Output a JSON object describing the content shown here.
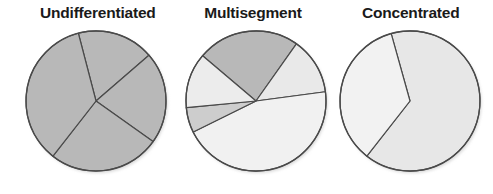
{
  "chart_data": [
    {
      "type": "pie",
      "title": "Undifferentiated",
      "center": [
        96,
        101
      ],
      "radius": 70,
      "start_angle_deg": 255.4,
      "slices": [
        {
          "label": "segment-1",
          "percent": 17.7,
          "color": "#b8b8b8"
        },
        {
          "label": "segment-2",
          "percent": 21.2,
          "color": "#b8b8b8"
        },
        {
          "label": "segment-3",
          "percent": 25.7,
          "color": "#b8b8b8"
        },
        {
          "label": "segment-4",
          "percent": 35.4,
          "color": "#b8b8b8"
        }
      ]
    },
    {
      "type": "pie",
      "title": "Multisegment",
      "center": [
        256,
        101
      ],
      "radius": 70,
      "start_angle_deg": 220.3,
      "slices": [
        {
          "label": "segment-1",
          "percent": 23.6,
          "color": "#b8b8b8"
        },
        {
          "label": "segment-2",
          "percent": 13.1,
          "color": "#e9e9e9"
        },
        {
          "label": "segment-3",
          "percent": 44.8,
          "color": "#f1f1f1"
        },
        {
          "label": "segment-4",
          "percent": 5.8,
          "color": "#cdcdcd"
        },
        {
          "label": "segment-5",
          "percent": 12.7,
          "color": "#ececec"
        }
      ]
    },
    {
      "type": "pie",
      "title": "Concentrated",
      "center": [
        410,
        101
      ],
      "radius": 70,
      "start_angle_deg": 254.4,
      "slices": [
        {
          "label": "segment-1",
          "percent": 64.9,
          "color": "#e7e7e7"
        },
        {
          "label": "segment-2",
          "percent": 35.1,
          "color": "#f2f2f2"
        }
      ]
    }
  ],
  "titles": {
    "undifferentiated": "Undifferentiated",
    "multisegment": "Multisegment",
    "concentrated": "Concentrated"
  },
  "colors": {
    "outline": "#4a4a4a",
    "title": "#1a1a1a"
  }
}
